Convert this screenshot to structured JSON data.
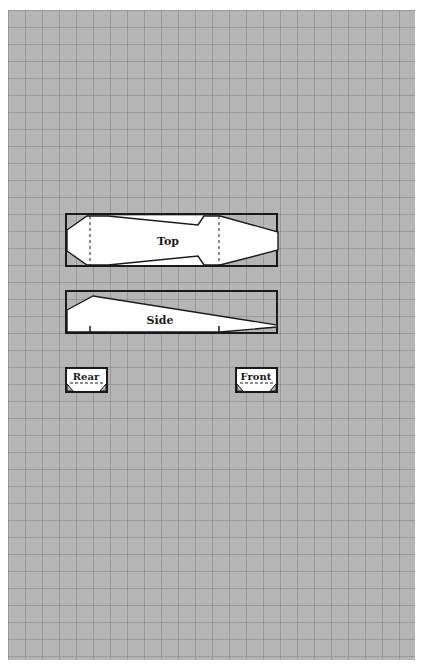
{
  "sheet": {
    "grid_spacing": 17,
    "paper_color": "#b5b5b5",
    "grid_line_color": "#7f7f7f",
    "outline_color": "#1a1a1a",
    "fill_color": "#ffffff"
  },
  "views": {
    "top": {
      "label": "Top"
    },
    "side": {
      "label": "Side"
    },
    "rear": {
      "label": "Rear"
    },
    "front": {
      "label": "Front"
    }
  }
}
